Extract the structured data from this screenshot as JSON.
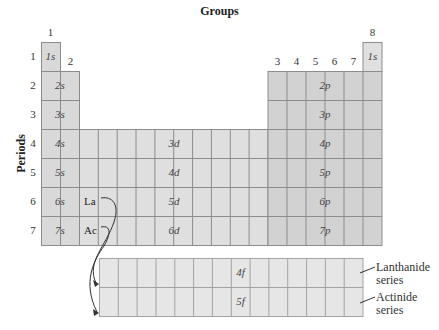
{
  "title": "Groups",
  "axis_label": "Periods",
  "group_labels": [
    "1",
    "2",
    "3",
    "4",
    "5",
    "6",
    "7",
    "8"
  ],
  "period_labels": [
    "1",
    "2",
    "3",
    "4",
    "5",
    "6",
    "7"
  ],
  "s_block": [
    "1s",
    "2s",
    "3s",
    "4s",
    "5s",
    "6s",
    "7s"
  ],
  "p_block": [
    "1s",
    "2p",
    "3p",
    "4p",
    "5p",
    "6p",
    "7p"
  ],
  "d_block": [
    "3d",
    "4d",
    "5d",
    "6d"
  ],
  "f_block": [
    "4f",
    "5f"
  ],
  "elements": {
    "la": "La",
    "ac": "Ac"
  },
  "series": {
    "lanthanide_1": "Lanthanide",
    "lanthanide_2": "series",
    "actinide_1": "Actinide",
    "actinide_2": "series"
  },
  "colors": {
    "s_block": "#d9d9d9",
    "d_block": "#dfdfdf",
    "p_block": "#d2d2d2",
    "f_block": "#e6e6e6",
    "grid": "#8c8c8c"
  }
}
